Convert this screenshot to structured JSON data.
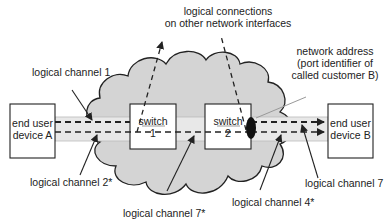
{
  "diagram": {
    "type": "network-logical-channels",
    "colors": {
      "cloud_fill": "#d4d4d4",
      "cloud_stroke": "#222222",
      "pipe_fill": "#e6e6e6",
      "box_fill": "#ffffff",
      "line": "#222222",
      "port_marker": "#111111",
      "leader_gray": "#999999"
    },
    "nodes": {
      "device_a": {
        "line1": "end user",
        "line2": "device A"
      },
      "device_b": {
        "line1": "end user",
        "line2": "device B"
      },
      "switch_1": {
        "line1": "switch",
        "line2": "1"
      },
      "switch_2": {
        "line1": "switch",
        "line2": "2"
      }
    },
    "labels": {
      "logical_connections_line1": "logical connections",
      "logical_connections_line2": "on other network interfaces",
      "network_address_line1": "network address",
      "network_address_line2": "(port identifier of",
      "network_address_line3": "called customer B)",
      "channel_1": "logical channel 1",
      "channel_2": "logical channel 2*",
      "channel_7_star": "logical channel 7*",
      "channel_4": "logical channel 4*",
      "channel_7": "logical channel 7"
    }
  }
}
